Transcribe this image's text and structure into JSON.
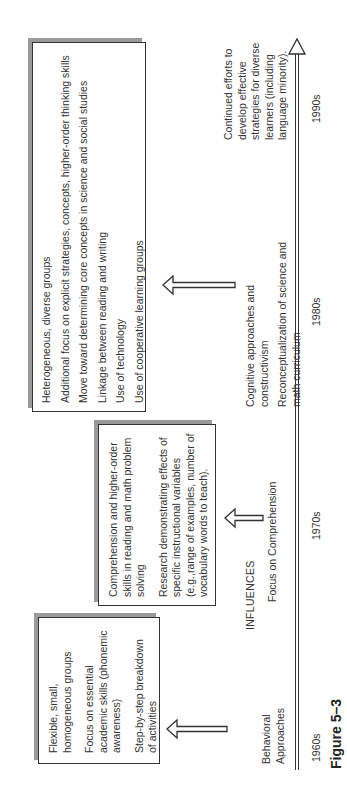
{
  "figure_label": "Figure 5–3",
  "influences_label": "INFLUENCES",
  "decades": [
    "1960s",
    "1970s",
    "1980s",
    "1990s"
  ],
  "eras": [
    {
      "decade": "1960s",
      "influence": [
        "Behavioral",
        "Approaches"
      ],
      "box_items": [
        "Flexible, small, homogeneous groups",
        "Focus on essential academic skills (phonemic awareness)",
        "Step-by-step breakdown of activities"
      ]
    },
    {
      "decade": "1970s",
      "influence": [
        "Focus on Comprehension"
      ],
      "box_items": [
        "Comprehension and higher-order skills in reading and math problem solving",
        "Research demonstrating effects of specific instructional variables (e.g.,range of examples, number of vocabulary words to teach)."
      ]
    },
    {
      "decade": "1980s",
      "influence": [
        "Cognitive approaches and constructivism",
        "Reconceptualization of science and math curriculum"
      ],
      "box_items": [
        "Heterogeneous, diverse groups",
        "Additional focus on explicit strategies, concepts, higher-order thinking skills",
        "Move toward determining core concepts in science and social studies",
        "Linkage between reading and writing",
        "Use of technology",
        "Use of cooperative learning groups"
      ]
    },
    {
      "decade": "1990s",
      "influence": [
        "Continued efforts to develop effective strategies for diverse learners (including language minority)."
      ]
    }
  ],
  "icons": {
    "up_arrow": "hollow-block-arrow",
    "timeline_arrow": "hollow-triangle-arrowhead"
  }
}
